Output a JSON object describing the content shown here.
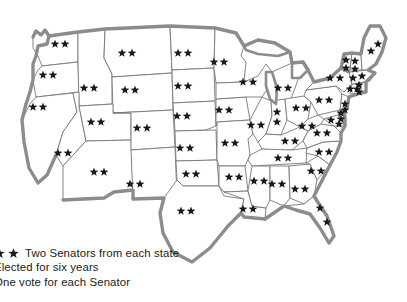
{
  "figure": {
    "background_color": "#ffffff",
    "border_color": "#8c8c8c",
    "state_line_color": "#777777",
    "star_color": "#1a1a1a"
  },
  "legend": {
    "star_icon_count": 2,
    "line1": "Two Senators from each state",
    "line2": "Elected for six years",
    "line3": "One vote for each Senator",
    "line2_visible": "lected for six years",
    "line3_visible": "ne vote for each Senator"
  },
  "map": {
    "region_label": "United States",
    "senators_per_state": 2,
    "states": [
      {
        "name": "Washington",
        "stars": 2,
        "star_positions": [
          [
            55,
            44
          ],
          [
            65,
            44
          ]
        ]
      },
      {
        "name": "Oregon",
        "stars": 2,
        "star_positions": [
          [
            43,
            75
          ],
          [
            53,
            75
          ]
        ]
      },
      {
        "name": "California",
        "stars": 2,
        "star_positions": [
          [
            33,
            107
          ],
          [
            43,
            107
          ]
        ]
      },
      {
        "name": "Idaho",
        "stars": 2,
        "star_positions": [
          [
            84,
            88
          ],
          [
            94,
            88
          ]
        ]
      },
      {
        "name": "Nevada",
        "stars": 2,
        "star_positions": [
          [
            58,
            153
          ],
          [
            68,
            153
          ]
        ]
      },
      {
        "name": "Montana",
        "stars": 2,
        "star_positions": [
          [
            122,
            53
          ],
          [
            132,
            53
          ]
        ]
      },
      {
        "name": "Wyoming",
        "stars": 2,
        "star_positions": [
          [
            125,
            90
          ],
          [
            135,
            90
          ]
        ]
      },
      {
        "name": "Utah",
        "stars": 2,
        "star_positions": [
          [
            91,
            122
          ],
          [
            101,
            122
          ]
        ]
      },
      {
        "name": "Arizona",
        "stars": 2,
        "star_positions": [
          [
            94,
            172
          ],
          [
            104,
            172
          ]
        ]
      },
      {
        "name": "Colorado",
        "stars": 2,
        "star_positions": [
          [
            137,
            128
          ],
          [
            147,
            128
          ]
        ]
      },
      {
        "name": "New Mexico",
        "stars": 2,
        "star_positions": [
          [
            130,
            184
          ],
          [
            140,
            184
          ]
        ]
      },
      {
        "name": "North Dakota",
        "stars": 2,
        "star_positions": [
          [
            178,
            53
          ],
          [
            188,
            53
          ]
        ]
      },
      {
        "name": "South Dakota",
        "stars": 2,
        "star_positions": [
          [
            178,
            86
          ],
          [
            188,
            86
          ]
        ]
      },
      {
        "name": "Nebraska",
        "stars": 2,
        "star_positions": [
          [
            177,
            116
          ],
          [
            187,
            116
          ]
        ]
      },
      {
        "name": "Kansas",
        "stars": 2,
        "star_positions": [
          [
            180,
            148
          ],
          [
            190,
            148
          ]
        ]
      },
      {
        "name": "Oklahoma",
        "stars": 2,
        "star_positions": [
          [
            186,
            174
          ],
          [
            196,
            174
          ]
        ]
      },
      {
        "name": "Texas",
        "stars": 2,
        "star_positions": [
          [
            181,
            211
          ],
          [
            191,
            211
          ]
        ]
      },
      {
        "name": "Minnesota",
        "stars": 2,
        "star_positions": [
          [
            214,
            62
          ],
          [
            224,
            62
          ]
        ]
      },
      {
        "name": "Iowa",
        "stars": 2,
        "star_positions": [
          [
            219,
            110
          ],
          [
            229,
            110
          ]
        ]
      },
      {
        "name": "Missouri",
        "stars": 2,
        "star_positions": [
          [
            225,
            143
          ],
          [
            235,
            143
          ]
        ]
      },
      {
        "name": "Arkansas",
        "stars": 2,
        "star_positions": [
          [
            229,
            177
          ],
          [
            239,
            177
          ]
        ]
      },
      {
        "name": "Louisiana",
        "stars": 2,
        "star_positions": [
          [
            243,
            209
          ],
          [
            253,
            209
          ]
        ]
      },
      {
        "name": "Wisconsin",
        "stars": 2,
        "star_positions": [
          [
            243,
            82
          ],
          [
            253,
            82
          ]
        ]
      },
      {
        "name": "Illinois",
        "stars": 2,
        "star_positions": [
          [
            251,
            125
          ],
          [
            261,
            125
          ]
        ]
      },
      {
        "name": "Michigan",
        "stars": 2,
        "star_positions": [
          [
            278,
            88
          ],
          [
            288,
            88
          ]
        ]
      },
      {
        "name": "Indiana",
        "stars": 2,
        "star_positions": [
          [
            277,
            112
          ],
          [
            277,
            122
          ]
        ]
      },
      {
        "name": "Ohio",
        "stars": 2,
        "star_positions": [
          [
            296,
            108
          ],
          [
            306,
            108
          ]
        ]
      },
      {
        "name": "Kentucky",
        "stars": 2,
        "star_positions": [
          [
            285,
            141
          ],
          [
            295,
            141
          ]
        ]
      },
      {
        "name": "Tennessee",
        "stars": 2,
        "star_positions": [
          [
            278,
            158
          ],
          [
            288,
            158
          ]
        ]
      },
      {
        "name": "Mississippi",
        "stars": 2,
        "star_positions": [
          [
            254,
            181
          ],
          [
            264,
            181
          ]
        ]
      },
      {
        "name": "Alabama",
        "stars": 2,
        "star_positions": [
          [
            272,
            184
          ],
          [
            282,
            184
          ]
        ]
      },
      {
        "name": "Georgia",
        "stars": 2,
        "star_positions": [
          [
            295,
            189
          ],
          [
            305,
            189
          ]
        ]
      },
      {
        "name": "Florida",
        "stars": 2,
        "star_positions": [
          [
            320,
            208
          ],
          [
            327,
            222
          ]
        ]
      },
      {
        "name": "South Carolina",
        "stars": 2,
        "star_positions": [
          [
            311,
            171
          ],
          [
            321,
            171
          ]
        ]
      },
      {
        "name": "North Carolina",
        "stars": 2,
        "star_positions": [
          [
            319,
            152
          ],
          [
            329,
            152
          ]
        ]
      },
      {
        "name": "Virginia",
        "stars": 2,
        "star_positions": [
          [
            317,
            133
          ],
          [
            327,
            133
          ]
        ]
      },
      {
        "name": "West Virginia",
        "stars": 2,
        "star_positions": [
          [
            302,
            126
          ],
          [
            312,
            126
          ]
        ]
      },
      {
        "name": "Maryland",
        "stars": 2,
        "star_positions": [
          [
            331,
            120
          ],
          [
            339,
            124
          ]
        ]
      },
      {
        "name": "Delaware",
        "stars": 2,
        "star_positions": [
          [
            341,
            113
          ],
          [
            341,
            119
          ]
        ]
      },
      {
        "name": "Pennsylvania",
        "stars": 2,
        "star_positions": [
          [
            319,
            100
          ],
          [
            329,
            100
          ]
        ]
      },
      {
        "name": "New Jersey",
        "stars": 2,
        "star_positions": [
          [
            345,
            104
          ],
          [
            345,
            110
          ]
        ]
      },
      {
        "name": "New York",
        "stars": 2,
        "star_positions": [
          [
            330,
            78
          ],
          [
            340,
            78
          ]
        ]
      },
      {
        "name": "Connecticut",
        "stars": 2,
        "star_positions": [
          [
            350,
            89
          ],
          [
            357,
            89
          ]
        ]
      },
      {
        "name": "Rhode Island",
        "stars": 2,
        "star_positions": [
          [
            359,
            85
          ],
          [
            359,
            92
          ]
        ]
      },
      {
        "name": "Massachusetts",
        "stars": 2,
        "star_positions": [
          [
            353,
            78
          ],
          [
            362,
            76
          ]
        ]
      },
      {
        "name": "Vermont",
        "stars": 2,
        "star_positions": [
          [
            346,
            60
          ],
          [
            346,
            68
          ]
        ]
      },
      {
        "name": "New Hampshire",
        "stars": 2,
        "star_positions": [
          [
            355,
            61
          ],
          [
            355,
            69
          ]
        ]
      },
      {
        "name": "Maine",
        "stars": 2,
        "star_positions": [
          [
            371,
            51
          ],
          [
            378,
            44
          ]
        ]
      }
    ]
  }
}
